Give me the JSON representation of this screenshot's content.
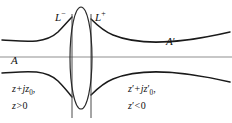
{
  "figure": {
    "colors": {
      "curve": "#1a1a1a",
      "axis": "#8a8a8a",
      "lens": "#333333",
      "reference_line": "#555555",
      "background": "#ffffff",
      "text": "#111111"
    },
    "labels": {
      "lens_left": {
        "base": "L",
        "sup": "−"
      },
      "lens_right": {
        "base": "L",
        "sup": "+"
      },
      "axis_left": "A",
      "axis_right": {
        "base": "A",
        "prime": "′"
      },
      "left_expr_line1": {
        "var": "z",
        "op": "+",
        "imag": "j",
        "var2": "z",
        "sub": "0",
        "tail": ","
      },
      "left_expr_line2": {
        "var": "z",
        "op": ">",
        "value": "0"
      },
      "right_expr_line1": {
        "var": "z",
        "prime": "′",
        "op": "+",
        "imag": "j",
        "var2": "z",
        "prime2": "′",
        "sub": "0",
        "tail": ","
      },
      "right_expr_line2": {
        "var": "z",
        "prime": "′",
        "op": "<",
        "value": "0"
      }
    },
    "geometry": {
      "width": 232,
      "height": 123,
      "axis_y": 57,
      "lens_center_x": 81,
      "lens_rx": 11,
      "lens_ry": 51,
      "ref_line_left_x": 72,
      "ref_line_right_x": 91,
      "ref_line_top_y": 14,
      "ref_line_bottom_y": 118,
      "waist_left_half_width": 22,
      "waist_right_half_width": 17,
      "curve_left_edge_y_upper": 40,
      "curve_right_edge_y_upper": 35
    }
  }
}
